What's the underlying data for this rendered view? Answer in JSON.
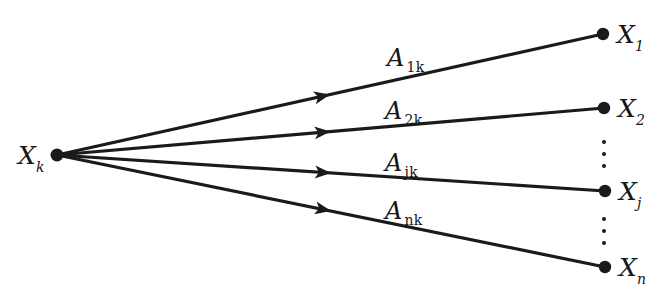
{
  "figure": {
    "background_color": "#ffffff",
    "ink_color": "#1a1a1a"
  },
  "source_node": {
    "id": "Xk",
    "label_var": "X",
    "label_sub": "k",
    "x": 57,
    "y": 155,
    "label_x": 18,
    "label_y": 143
  },
  "target_nodes": [
    {
      "id": "X1",
      "label_var": "X",
      "label_sub": "1",
      "x": 603,
      "y": 34,
      "label_x": 617,
      "label_y": 22
    },
    {
      "id": "X2",
      "label_var": "X",
      "label_sub": "2",
      "x": 604,
      "y": 108,
      "label_x": 618,
      "label_y": 96
    },
    {
      "id": "Xj",
      "label_var": "X",
      "label_sub": "j",
      "x": 605,
      "y": 191,
      "label_x": 619,
      "label_y": 179
    },
    {
      "id": "Xn",
      "label_var": "X",
      "label_sub": "n",
      "x": 605,
      "y": 267,
      "label_x": 619,
      "label_y": 255
    }
  ],
  "edges": [
    {
      "id": "edge-1k",
      "from": "Xk",
      "to": "X1",
      "label_var": "A",
      "label_sub": "1k",
      "label_x": 387,
      "label_y": 46,
      "arrow_t": 0.5
    },
    {
      "id": "edge-2k",
      "from": "Xk",
      "to": "X2",
      "label_var": "A",
      "label_sub": "2k",
      "label_x": 385,
      "label_y": 99,
      "arrow_t": 0.5
    },
    {
      "id": "edge-jk",
      "from": "Xk",
      "to": "Xj",
      "label_var": "A",
      "label_sub": "jk",
      "label_x": 385,
      "label_y": 151,
      "arrow_t": 0.5
    },
    {
      "id": "edge-nk",
      "from": "Xk",
      "to": "Xn",
      "label_var": "A",
      "label_sub": "nk",
      "label_x": 385,
      "label_y": 199,
      "arrow_t": 0.5
    }
  ],
  "ellipses": [
    {
      "id": "ellipsis-upper",
      "x": 602,
      "y": 140,
      "dots": 3
    },
    {
      "id": "ellipsis-lower",
      "x": 602,
      "y": 217,
      "dots": 3
    }
  ]
}
